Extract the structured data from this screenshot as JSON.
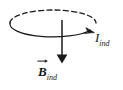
{
  "figure": {
    "background_color": "#ffffff",
    "stroke_color": "#1a1a1a",
    "labels": {
      "current": {
        "symbol": "I",
        "subscript": "ind",
        "full_text": "I_ind",
        "meaning": "induced current"
      },
      "bfield": {
        "symbol": "B",
        "subscript": "ind",
        "full_text": "B_ind",
        "meaning": "induced magnetic field",
        "is_vector": true
      }
    },
    "elements": {
      "loop": {
        "name": "current-loop-ellipse",
        "back_arc_style": "dashed",
        "front_arc_style": "solid",
        "center_x": 53,
        "center_y": 23,
        "radius_x": 43,
        "radius_y": 13
      },
      "current_arrow": {
        "name": "current-direction-arrowhead",
        "direction": "clockwise",
        "tip_x": 93,
        "tip_y": 32
      },
      "field_arrow": {
        "name": "magnetic-field-arrow",
        "direction": "down",
        "x": 62,
        "y_start": 20,
        "y_end": 63
      }
    }
  }
}
